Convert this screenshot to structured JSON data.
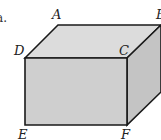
{
  "figure": {
    "prefix": "a.",
    "shape": "rectangular-prism",
    "vertices": {
      "A": "A",
      "B": "B",
      "C": "C",
      "D": "D",
      "E": "E",
      "F": "F"
    },
    "colors": {
      "front_face": "#cfcfcf",
      "top_face": "#dcdcdc",
      "side_face": "#c4c4c4",
      "edge": "#1a1a1a"
    }
  }
}
